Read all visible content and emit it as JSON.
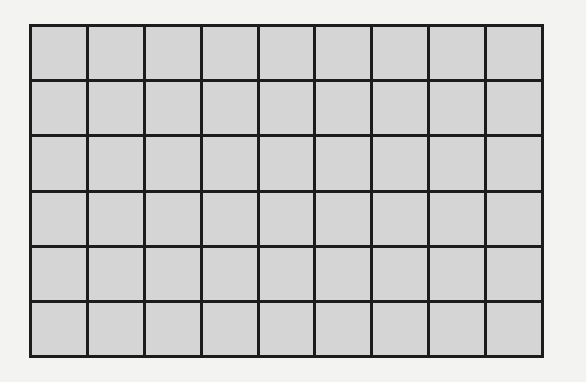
{
  "diagram": {
    "type": "rectangular-grid",
    "rows": 6,
    "columns": 9,
    "total_unit_squares": 54,
    "colors": {
      "background": "#f3f3f1",
      "cell_fill": "#d5d5d5",
      "grid_line": "#1c1c1c"
    }
  }
}
